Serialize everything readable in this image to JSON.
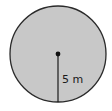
{
  "diagram": {
    "shape": "circle",
    "fill_color": "#c8c8c8",
    "stroke_color": "#2a2a2a",
    "radius_label": "5 m",
    "radius_value": 5,
    "radius_unit": "m"
  }
}
